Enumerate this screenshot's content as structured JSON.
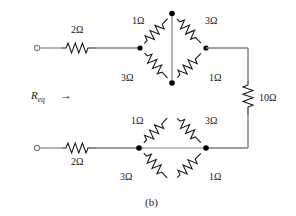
{
  "figure": {
    "caption": "(b)",
    "input_label": "R",
    "input_label_sub": "eq",
    "arrow_glyph": "→",
    "ohm": "Ω",
    "colors": {
      "wire": "#808080",
      "resistor": "#1a1a1a",
      "node": "#000000",
      "text": "#1a1a1a",
      "background": "#ffffff"
    }
  },
  "labels": {
    "series_top": "2Ω",
    "series_bottom": "2Ω",
    "bridge_right": "10Ω",
    "top_bridge": {
      "upper_left": "1Ω",
      "upper_right": "3Ω",
      "lower_left": "3Ω",
      "lower_right": "1Ω"
    },
    "bottom_bridge": {
      "upper_left": "1Ω",
      "upper_right": "3Ω",
      "lower_left": "3Ω",
      "lower_right": "1Ω"
    }
  },
  "components": [
    {
      "id": "r-series-top",
      "name": "2-ohm-series-top-resistor",
      "value": "2Ω",
      "orientation": "horizontal"
    },
    {
      "id": "r-series-bottom",
      "name": "2-ohm-series-bottom-resistor",
      "value": "2Ω",
      "orientation": "horizontal"
    },
    {
      "id": "r-bridge-right",
      "name": "10-ohm-vertical-resistor",
      "value": "10Ω",
      "orientation": "vertical"
    },
    {
      "id": "r-top-ul",
      "name": "1-ohm-top-bridge-upper-left-resistor",
      "value": "1Ω",
      "orientation": "diagonal"
    },
    {
      "id": "r-top-ur",
      "name": "3-ohm-top-bridge-upper-right-resistor",
      "value": "3Ω",
      "orientation": "diagonal"
    },
    {
      "id": "r-top-ll",
      "name": "3-ohm-top-bridge-lower-left-resistor",
      "value": "3Ω",
      "orientation": "diagonal"
    },
    {
      "id": "r-top-lr",
      "name": "1-ohm-top-bridge-lower-right-resistor",
      "value": "1Ω",
      "orientation": "diagonal"
    },
    {
      "id": "r-bot-ul",
      "name": "1-ohm-bottom-bridge-upper-left-resistor",
      "value": "1Ω",
      "orientation": "diagonal"
    },
    {
      "id": "r-bot-ur",
      "name": "3-ohm-bottom-bridge-upper-right-resistor",
      "value": "3Ω",
      "orientation": "diagonal"
    },
    {
      "id": "r-bot-ll",
      "name": "3-ohm-bottom-bridge-lower-left-resistor",
      "value": "3Ω",
      "orientation": "diagonal"
    },
    {
      "id": "r-bot-lr",
      "name": "1-ohm-bottom-bridge-lower-right-resistor",
      "value": "1Ω",
      "orientation": "diagonal"
    }
  ]
}
